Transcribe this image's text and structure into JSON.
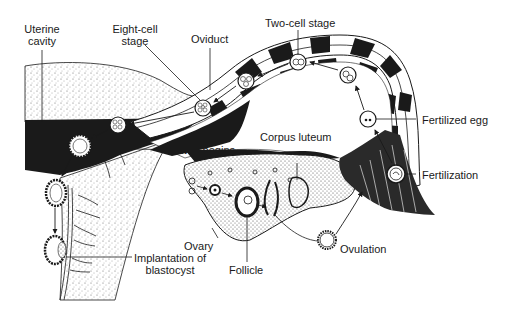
{
  "diagram": {
    "colors": {
      "ink": "#1a1a1a",
      "stipple": "#8a8a8a",
      "background": "#ffffff"
    },
    "labels": {
      "uterine_cavity_line1": "Uterine",
      "uterine_cavity_line2": "cavity",
      "eight_cell_line1": "Eight-cell",
      "eight_cell_line2": "stage",
      "oviduct": "Oviduct",
      "two_cell_stage": "Two-cell stage",
      "fertilized_egg": "Fertilized egg",
      "cavity_begins": "Cavity begins",
      "corpus_luteum": "Corpus luteum",
      "fertilization": "Fertilization",
      "ovary": "Ovary",
      "follicle": "Follicle",
      "ovulation": "Ovulation",
      "implantation_line1": "Implantation of",
      "implantation_line2": "blastocyst"
    },
    "sequence": [
      "Follicle",
      "Ovulation",
      "Fertilization",
      "Fertilized egg",
      "Two-cell stage",
      "Eight-cell stage",
      "Cavity begins",
      "Implantation of blastocyst"
    ]
  }
}
